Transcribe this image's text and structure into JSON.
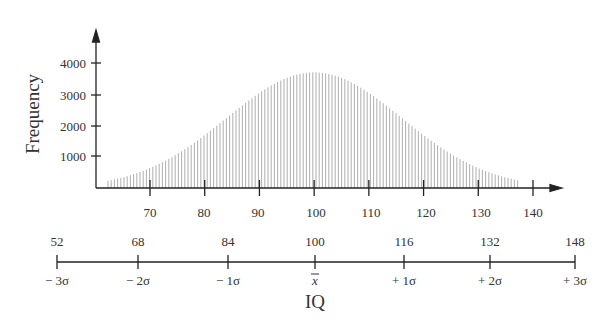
{
  "chart_data": {
    "type": "bar",
    "title": "",
    "xlabel": "IQ",
    "ylabel": "Frequency",
    "x_ticks": [
      70,
      80,
      90,
      100,
      110,
      120,
      130,
      140
    ],
    "y_ticks": [
      1000,
      2000,
      3000,
      4000
    ],
    "ylim": [
      0,
      4000
    ],
    "distribution": {
      "mean": 100,
      "sd": 16,
      "peak_frequency": 3700,
      "x_range": [
        64,
        136
      ]
    },
    "sigma_scale": {
      "values": [
        "52",
        "68",
        "84",
        "100",
        "116",
        "132",
        "148"
      ],
      "labels": [
        "− 3σ",
        "− 2σ",
        "− 1σ",
        "x̄",
        "+ 1σ",
        "+ 2σ",
        "+ 3σ"
      ]
    },
    "grid": false,
    "legend": null
  },
  "labels": {
    "ylabel": "Frequency",
    "xlabel": "IQ",
    "y_ticks": [
      "1000",
      "2000",
      "3000",
      "4000"
    ],
    "x_ticks": [
      "70",
      "80",
      "90",
      "100",
      "110",
      "120",
      "130",
      "140"
    ],
    "sigma_values": [
      "52",
      "68",
      "84",
      "100",
      "116",
      "132",
      "148"
    ],
    "sigma_labels": [
      "− 3σ",
      "− 2σ",
      "− 1σ",
      "x",
      "+ 1σ",
      "+ 2σ",
      "+ 3σ"
    ]
  }
}
